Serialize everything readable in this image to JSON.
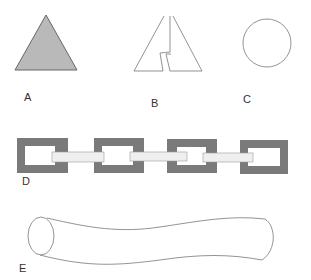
{
  "figure": {
    "colors": {
      "fill_gray": "#b9b9b9",
      "link_gray": "#7a7a7a",
      "stroke": "#666666",
      "bar_fill": "#efefef",
      "background": "#ffffff"
    },
    "panels": [
      {
        "id": "A",
        "label": "A",
        "shape": "filled-triangle"
      },
      {
        "id": "B",
        "label": "B",
        "shape": "split-triangle-outline"
      },
      {
        "id": "C",
        "label": "C",
        "shape": "circle-outline"
      },
      {
        "id": "D",
        "label": "D",
        "shape": "chain-of-square-links"
      },
      {
        "id": "E",
        "label": "E",
        "shape": "curved-tube"
      }
    ]
  }
}
